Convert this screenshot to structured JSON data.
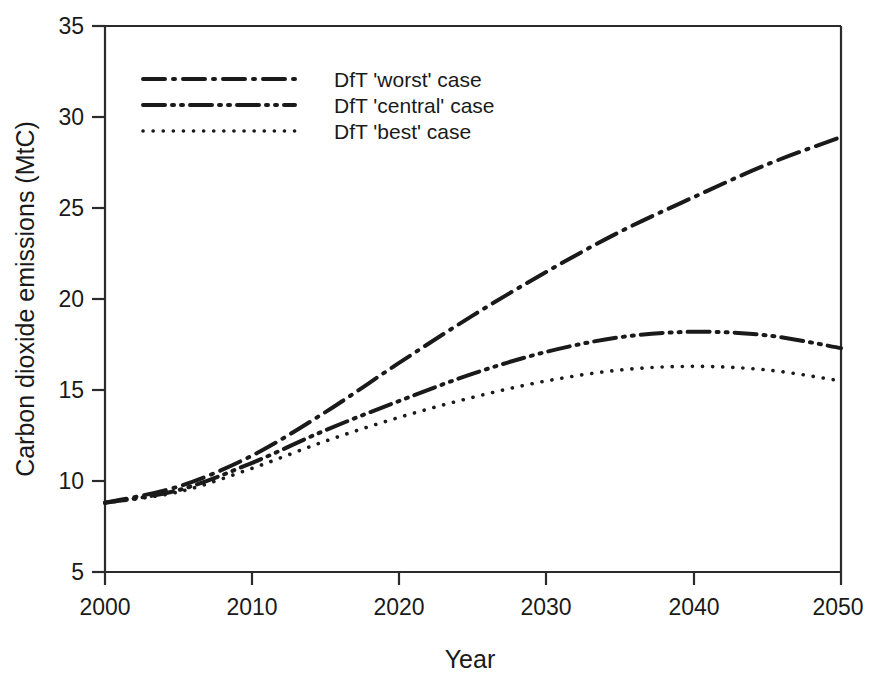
{
  "figure": {
    "background_color": "#ffffff",
    "line_color": "#1a1a1a"
  },
  "axes": {
    "x": {
      "title": "Year",
      "ticks": [
        "2000",
        "2010",
        "2020",
        "2030",
        "2040",
        "2050"
      ],
      "min": 2000,
      "max": 2050
    },
    "y": {
      "title": "Carbon dioxide emissions (MtC)",
      "ticks": [
        "5",
        "10",
        "15",
        "20",
        "25",
        "30",
        "35"
      ],
      "min": 5,
      "max": 35
    }
  },
  "legend": {
    "items": [
      {
        "label": "DfT 'worst' case",
        "style": "dash-dot"
      },
      {
        "label": "DfT 'central' case",
        "style": "dash-dot-dot"
      },
      {
        "label": "DfT  'best' case",
        "style": "dotted"
      }
    ]
  },
  "chart_data": {
    "type": "line",
    "title": "",
    "xlabel": "Year",
    "ylabel": "Carbon dioxide emissions (MtC)",
    "xlim": [
      2000,
      2050
    ],
    "ylim": [
      5,
      35
    ],
    "grid": false,
    "legend_position": "upper-left-inside",
    "x": [
      2000,
      2005,
      2010,
      2015,
      2020,
      2025,
      2030,
      2035,
      2040,
      2045,
      2050
    ],
    "series": [
      {
        "name": "DfT 'worst' case",
        "style": "dash-dot",
        "values": [
          8.8,
          9.7,
          11.4,
          13.8,
          16.5,
          19.1,
          21.5,
          23.7,
          25.6,
          27.4,
          28.9
        ]
      },
      {
        "name": "DfT 'central' case",
        "style": "dash-dot-dot",
        "values": [
          8.8,
          9.5,
          11.0,
          12.8,
          14.4,
          15.9,
          17.1,
          17.9,
          18.2,
          18.0,
          17.3
        ]
      },
      {
        "name": "DfT  'best' case",
        "style": "dotted",
        "values": [
          8.8,
          9.4,
          10.7,
          12.2,
          13.5,
          14.6,
          15.5,
          16.1,
          16.3,
          16.1,
          15.5
        ]
      }
    ]
  }
}
